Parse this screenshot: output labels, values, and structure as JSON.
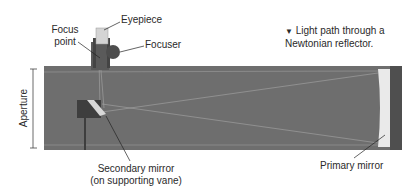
{
  "caption": {
    "marker": "▼",
    "line1": "Light path through a",
    "line2": "Newtonian reflector."
  },
  "labels": {
    "eyepiece": "Eyepiece",
    "focus_point_line1": "Focus",
    "focus_point_line2": "point",
    "focuser": "Focuser",
    "aperture": "Aperture",
    "secondary_line1": "Secondary mirror",
    "secondary_line2": "(on supporting vane)",
    "primary": "Primary mirror"
  },
  "colors": {
    "tube": "#6e6e6e",
    "tube_dark": "#4a4a4a",
    "mirror": "#e8e8e8",
    "light_path": "#a8a8a8",
    "leader": "#222222"
  }
}
